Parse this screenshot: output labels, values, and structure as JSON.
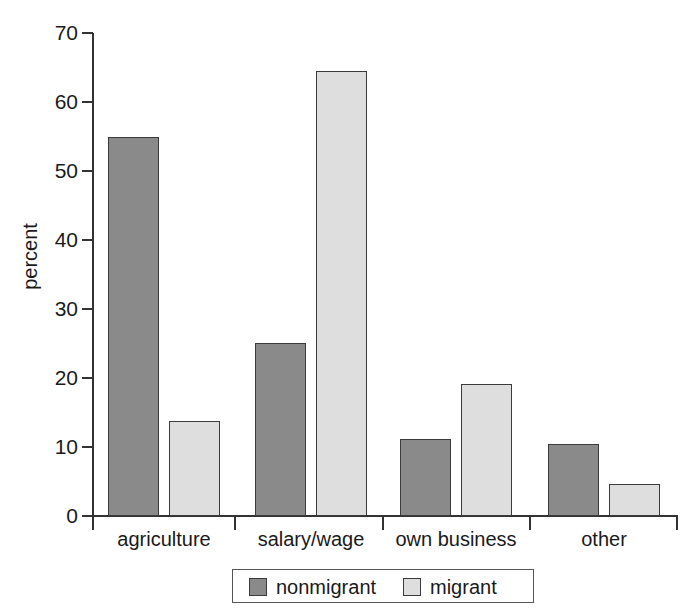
{
  "chart_data": {
    "type": "bar",
    "title": "",
    "xlabel": "",
    "ylabel": "percent",
    "ylim": [
      0,
      70
    ],
    "ytick_values": [
      0,
      10,
      20,
      30,
      40,
      50,
      60,
      70
    ],
    "ytick_labels": [
      "0",
      "10",
      "20",
      "30",
      "40",
      "50",
      "60",
      "70"
    ],
    "grid": false,
    "legend_position": "bottom",
    "categories": [
      "agriculture",
      "salary/wage",
      "own business",
      "other"
    ],
    "series": [
      {
        "name": "nonmigrant",
        "color": "#8a8a8a",
        "values": [
          55.0,
          25.1,
          11.2,
          10.5
        ]
      },
      {
        "name": "migrant",
        "color": "#dedede",
        "values": [
          13.8,
          64.5,
          19.2,
          4.6
        ]
      }
    ]
  },
  "legend": {
    "entries": [
      {
        "label": "nonmigrant",
        "swatch": "#8a8a8a"
      },
      {
        "label": "migrant",
        "swatch": "#dedede"
      }
    ]
  },
  "colors": {
    "nonmigrant": "#8a8a8a",
    "migrant": "#dedede",
    "axis": "#333333",
    "bar_edge": "#3b3b3b",
    "background": "#ffffff"
  }
}
